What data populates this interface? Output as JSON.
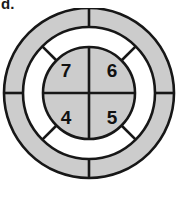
{
  "figure": {
    "option_label": "d.",
    "type": "concentric-circles-diagram",
    "colors": {
      "ring_gray": "#cccccc",
      "ring_white": "#ffffff",
      "stroke": "#171717",
      "text": "#111111",
      "background": "#ffffff"
    },
    "geometry": {
      "center_x": 89,
      "center_y": 93,
      "outer_radius": 85,
      "middle_radius": 66,
      "inner_radius": 46
    },
    "rings": [
      {
        "name": "outer-ring",
        "fill": "#cccccc",
        "divider_angles_deg": [
          0,
          90,
          180,
          270
        ],
        "segments": 4
      },
      {
        "name": "middle-ring",
        "fill": "#ffffff",
        "divider_angles_deg": [
          45,
          135,
          225,
          315
        ],
        "segments": 4
      },
      {
        "name": "inner-disc",
        "fill": "#cccccc",
        "divider_angles_deg": [
          0,
          90,
          180,
          270
        ],
        "segments": 4
      }
    ],
    "inner_cells": [
      {
        "position": "top-left",
        "value": "7",
        "x": 66,
        "y": 70
      },
      {
        "position": "top-right",
        "value": "6",
        "x": 112,
        "y": 70
      },
      {
        "position": "bottom-left",
        "value": "4",
        "x": 66,
        "y": 117
      },
      {
        "position": "bottom-right",
        "value": "5",
        "x": 112,
        "y": 117
      }
    ]
  }
}
